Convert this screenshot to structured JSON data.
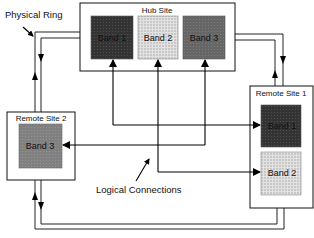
{
  "labels": {
    "physical_ring": "Physical Ring",
    "logical_connections": "Logical Connections"
  },
  "hub_site": {
    "title": "Hub Site",
    "bands": [
      {
        "label": "Band 1",
        "fill": "#3a3a3a"
      },
      {
        "label": "Band 2",
        "fill": "#d4d4d4"
      },
      {
        "label": "Band 3",
        "fill": "#5e5e5e"
      }
    ]
  },
  "remote_site_1": {
    "title": "Remote Site 1",
    "bands": [
      {
        "label": "Band 1",
        "fill": "#3a3a3a"
      },
      {
        "label": "Band 2",
        "fill": "#d4d4d4"
      }
    ]
  },
  "remote_site_2": {
    "title": "Remote Site 2",
    "bands": [
      {
        "label": "Band 3",
        "fill": "#7a7a7a"
      }
    ]
  },
  "connections": [
    {
      "from": "Hub Site Band 1",
      "to": "Remote Site 1 Band 1"
    },
    {
      "from": "Hub Site Band 2",
      "to": "Remote Site 1 Band 2"
    },
    {
      "from": "Hub Site Band 3",
      "to": "Remote Site 2 Band 3"
    }
  ]
}
